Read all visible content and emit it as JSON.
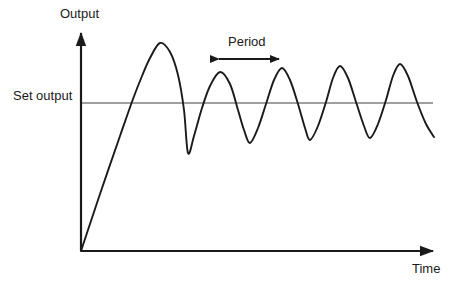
{
  "figure": {
    "background_color": "#ffffff",
    "axis_color": "#1a1a1a",
    "curve_color": "#1a1a1a",
    "setpoint_line_color": "#808080",
    "width": 457,
    "height": 287
  },
  "labels": {
    "y_axis": "Output",
    "x_axis": "Time",
    "setpoint": "Set output",
    "period": "Period"
  },
  "chart_data": {
    "type": "line",
    "title": "",
    "xlabel": "Time",
    "ylabel": "Output",
    "grid": false,
    "legend": null,
    "axes": {
      "origin_px": [
        81,
        251
      ],
      "x_axis_end_px": [
        437,
        251
      ],
      "y_axis_top_px": [
        81,
        30
      ],
      "arrowheads": [
        "x-axis-right",
        "y-axis-top"
      ],
      "tick_labels_x": [],
      "tick_labels_y": []
    },
    "annotations": [
      {
        "name": "setpoint-line",
        "text": "Set output",
        "style": "horizontal-reference-line",
        "color": "#808080",
        "y_px": 103,
        "x_start_px": 81,
        "x_end_px": 433
      },
      {
        "name": "period-measure",
        "text": "Period",
        "style": "double-headed-arrow",
        "color": "#1a1a1a",
        "y_px": 59,
        "x_start_px": 218,
        "x_end_px": 280,
        "label_center_px": [
          249,
          43
        ]
      }
    ],
    "series": [
      {
        "name": "Output response",
        "description": "Underdamped step response: linear rise from origin then slowly decaying oscillation about the set output",
        "points_px": [
          [
            81,
            251
          ],
          [
            100,
            194
          ],
          [
            120,
            136
          ],
          [
            133,
            99
          ],
          [
            142,
            76
          ],
          [
            150,
            58
          ],
          [
            160,
            43
          ],
          [
            170,
            52
          ],
          [
            178,
            75
          ],
          [
            184,
            110
          ],
          [
            188,
            153
          ],
          [
            194,
            136
          ],
          [
            202,
            108
          ],
          [
            210,
            86
          ],
          [
            220,
            72
          ],
          [
            230,
            84
          ],
          [
            238,
            110
          ],
          [
            244,
            130
          ],
          [
            250,
            143
          ],
          [
            258,
            128
          ],
          [
            266,
            104
          ],
          [
            274,
            80
          ],
          [
            282,
            68
          ],
          [
            290,
            80
          ],
          [
            298,
            104
          ],
          [
            305,
            128
          ],
          [
            310,
            140
          ],
          [
            318,
            126
          ],
          [
            326,
            102
          ],
          [
            333,
            78
          ],
          [
            340,
            66
          ],
          [
            348,
            78
          ],
          [
            356,
            102
          ],
          [
            364,
            126
          ],
          [
            370,
            138
          ],
          [
            378,
            124
          ],
          [
            386,
            100
          ],
          [
            393,
            76
          ],
          [
            400,
            64
          ],
          [
            408,
            76
          ],
          [
            417,
            102
          ],
          [
            426,
            124
          ],
          [
            434,
            137
          ]
        ],
        "peaks_px": [
          [
            160,
            43
          ],
          [
            220,
            72
          ],
          [
            282,
            68
          ],
          [
            340,
            66
          ],
          [
            400,
            64
          ]
        ],
        "troughs_px": [
          [
            188,
            153
          ],
          [
            250,
            143
          ],
          [
            310,
            140
          ],
          [
            370,
            138
          ]
        ],
        "period_px": 60
      }
    ]
  }
}
